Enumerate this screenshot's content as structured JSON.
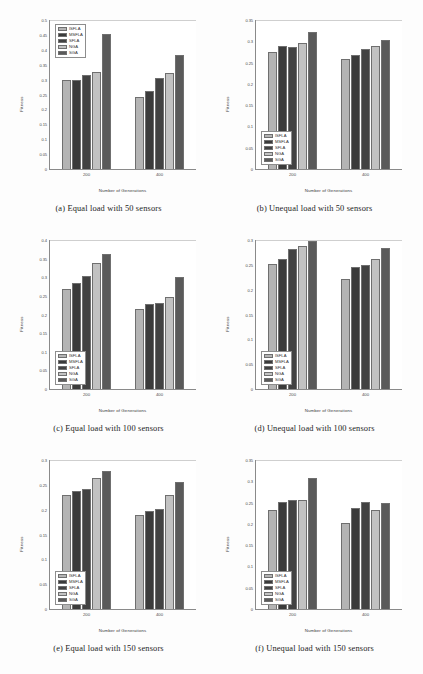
{
  "figure": {
    "series_names": [
      "ISFLA",
      "MSFLA",
      "SFLA",
      "NGA",
      "SGA"
    ],
    "series_colors": [
      "#b4b4b4",
      "#3b3b3b",
      "#424242",
      "#c2c2c2",
      "#5a5a5a"
    ],
    "xlabel": "Number of Generations",
    "ylabel": "Fitness",
    "categories": [
      "200",
      "400"
    ]
  },
  "chart_data": [
    {
      "type": "bar",
      "panel": "a",
      "caption": "(a) Equal load with 50 sensors",
      "title": "",
      "xlabel": "Number of Generations",
      "ylabel": "Fitness",
      "categories": [
        "200",
        "400"
      ],
      "ylim": [
        0,
        0.5
      ],
      "yticks": [
        "0",
        "0.05",
        "0.1",
        "0.15",
        "0.2",
        "0.25",
        "0.3",
        "0.35",
        "0.4",
        "0.45",
        "0.5"
      ],
      "grid": false,
      "legend_position": "top-left",
      "series": [
        {
          "name": "ISFLA",
          "values": [
            0.3,
            0.24
          ]
        },
        {
          "name": "MSFLA",
          "values": [
            0.3,
            0.263
          ]
        },
        {
          "name": "SFLA",
          "values": [
            0.315,
            0.305
          ]
        },
        {
          "name": "NGA",
          "values": [
            0.327,
            0.323
          ]
        },
        {
          "name": "SGA",
          "values": [
            0.452,
            0.383
          ]
        }
      ]
    },
    {
      "type": "bar",
      "panel": "b",
      "caption": "(b) Unequal load with 50 sensors",
      "title": "",
      "xlabel": "Number of Generations",
      "ylabel": "Fitness",
      "categories": [
        "200",
        "400"
      ],
      "ylim": [
        0,
        0.35
      ],
      "yticks": [
        "0",
        "0.05",
        "0.1",
        "0.15",
        "0.2",
        "0.25",
        "0.3",
        "0.35"
      ],
      "grid": false,
      "legend_position": "bottom-left",
      "series": [
        {
          "name": "ISFLA",
          "values": [
            0.274,
            0.259
          ]
        },
        {
          "name": "MSFLA",
          "values": [
            0.288,
            0.268
          ]
        },
        {
          "name": "SFLA",
          "values": [
            0.287,
            0.281
          ]
        },
        {
          "name": "NGA",
          "values": [
            0.296,
            0.288
          ]
        },
        {
          "name": "SGA",
          "values": [
            0.322,
            0.304
          ]
        }
      ]
    },
    {
      "type": "bar",
      "panel": "c",
      "caption": "(c) Equal load with 100 sensors",
      "title": "",
      "xlabel": "Number of Generations",
      "ylabel": "Fitness",
      "categories": [
        "200",
        "400"
      ],
      "ylim": [
        0,
        0.4
      ],
      "yticks": [
        "0",
        "0.05",
        "0.1",
        "0.15",
        "0.2",
        "0.25",
        "0.3",
        "0.35",
        "0.4"
      ],
      "grid": false,
      "legend_position": "bottom-left",
      "series": [
        {
          "name": "ISFLA",
          "values": [
            0.268,
            0.216
          ]
        },
        {
          "name": "MSFLA",
          "values": [
            0.285,
            0.228
          ]
        },
        {
          "name": "SFLA",
          "values": [
            0.303,
            0.23
          ]
        },
        {
          "name": "NGA",
          "values": [
            0.337,
            0.247
          ]
        },
        {
          "name": "SGA",
          "values": [
            0.362,
            0.301
          ]
        }
      ]
    },
    {
      "type": "bar",
      "panel": "d",
      "caption": "(d) Unequal load with 100 sensors",
      "title": "",
      "xlabel": "Number of Generations",
      "ylabel": "Fitness",
      "categories": [
        "200",
        "400"
      ],
      "ylim": [
        0,
        0.3
      ],
      "yticks": [
        "0",
        "0.05",
        "0.1",
        "0.15",
        "0.2",
        "0.25",
        "0.3"
      ],
      "grid": false,
      "legend_position": "bottom-left",
      "series": [
        {
          "name": "ISFLA",
          "values": [
            0.251,
            0.222
          ]
        },
        {
          "name": "MSFLA",
          "values": [
            0.262,
            0.245
          ]
        },
        {
          "name": "SFLA",
          "values": [
            0.282,
            0.249
          ]
        },
        {
          "name": "NGA",
          "values": [
            0.288,
            0.262
          ]
        },
        {
          "name": "SGA",
          "values": [
            0.298,
            0.283
          ]
        }
      ]
    },
    {
      "type": "bar",
      "panel": "e",
      "caption": "(e) Equal load with 150 sensors",
      "title": "",
      "xlabel": "Number of Generations",
      "ylabel": "Fitness",
      "categories": [
        "200",
        "400"
      ],
      "ylim": [
        0,
        0.3
      ],
      "yticks": [
        "0",
        "0.05",
        "0.1",
        "0.15",
        "0.2",
        "0.25",
        "0.3"
      ],
      "grid": false,
      "legend_position": "bottom-left",
      "series": [
        {
          "name": "ISFLA",
          "values": [
            0.23,
            0.19
          ]
        },
        {
          "name": "MSFLA",
          "values": [
            0.237,
            0.197
          ]
        },
        {
          "name": "SFLA",
          "values": [
            0.241,
            0.201
          ]
        },
        {
          "name": "NGA",
          "values": [
            0.264,
            0.23
          ]
        },
        {
          "name": "SGA",
          "values": [
            0.277,
            0.256
          ]
        }
      ]
    },
    {
      "type": "bar",
      "panel": "f",
      "caption": "(f) Unequal load with 150 sensors",
      "title": "",
      "xlabel": "Number of Generations",
      "ylabel": "Fitness",
      "categories": [
        "200",
        "400"
      ],
      "ylim": [
        0,
        0.35
      ],
      "yticks": [
        "0",
        "0.05",
        "0.1",
        "0.15",
        "0.2",
        "0.25",
        "0.3",
        "0.35"
      ],
      "grid": false,
      "legend_position": "bottom-left",
      "series": [
        {
          "name": "ISFLA",
          "values": [
            0.232,
            0.201
          ]
        },
        {
          "name": "MSFLA",
          "values": [
            0.252,
            0.238
          ]
        },
        {
          "name": "SFLA",
          "values": [
            0.255,
            0.252
          ]
        },
        {
          "name": "NGA",
          "values": [
            0.257,
            0.233
          ]
        },
        {
          "name": "SGA",
          "values": [
            0.307,
            0.25
          ]
        }
      ]
    }
  ]
}
